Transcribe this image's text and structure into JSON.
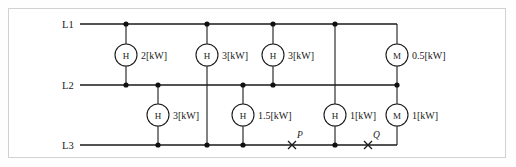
{
  "diagram": {
    "buses": [
      {
        "id": "L1",
        "label": "L1",
        "y": 24
      },
      {
        "id": "L2",
        "label": "L2",
        "y": 85
      },
      {
        "id": "L3",
        "label": "L3",
        "y": 145
      }
    ],
    "meters": [
      {
        "id": "m1",
        "symbol": "H",
        "value": "2[kW]",
        "x": 126,
        "y": 55,
        "from": "L1",
        "to": "L2"
      },
      {
        "id": "m2",
        "symbol": "H",
        "value": "3[kW]",
        "x": 207,
        "y": 55,
        "from": "L1",
        "to": "L2"
      },
      {
        "id": "m3",
        "symbol": "H",
        "value": "3[kW]",
        "x": 273,
        "y": 55,
        "from": "L1",
        "to": "L2"
      },
      {
        "id": "m4",
        "symbol": "M",
        "value": "0.5[kW]",
        "x": 397,
        "y": 55,
        "from": "L1",
        "to": "L2"
      },
      {
        "id": "m5",
        "symbol": "H",
        "value": "3[kW]",
        "x": 158,
        "y": 115,
        "from": "L2",
        "to": "L3"
      },
      {
        "id": "m6",
        "symbol": "H",
        "value": "1.5[kW]",
        "x": 243,
        "y": 115,
        "from": "L2",
        "to": "L3"
      },
      {
        "id": "m7",
        "symbol": "H",
        "value": "1[kW]",
        "x": 335,
        "y": 115,
        "from": "L2",
        "to": "L3"
      },
      {
        "id": "m8",
        "symbol": "M",
        "value": "1[kW]",
        "x": 397,
        "y": 115,
        "from": "L2",
        "to": "L3"
      }
    ],
    "fault_markers": [
      {
        "id": "p",
        "label": "P",
        "x": 292,
        "y": 145
      },
      {
        "id": "q",
        "label": "Q",
        "x": 368,
        "y": 145
      }
    ],
    "colors": {
      "wire": "#1a1a1a",
      "node": "#111111",
      "frame": "#d2d2d2",
      "background": "#ffffff"
    }
  }
}
